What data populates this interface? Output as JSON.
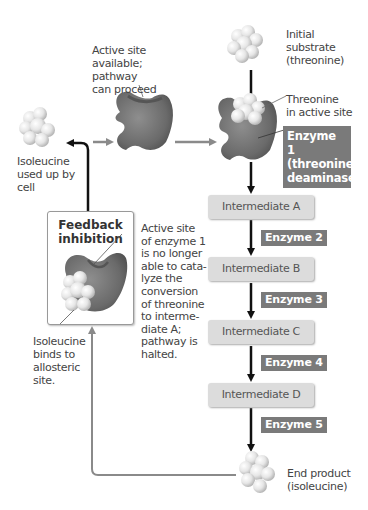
{
  "diagram": {
    "labels": {
      "initial_substrate": "Initial substrate (threonine)",
      "active_site_available": "Active site available; pathway can proceed",
      "threonine_in_active_site": "Threonine in active site",
      "isoleucine_used": "Isoleucine used up by cell",
      "feedback_title": "Feedback inhibition",
      "active_site_blocked": "Active site of enzyme 1 is no longer able to catalyze the conversion of threonine to intermediate A; pathway is halted.",
      "isoleucine_binds": "Isoleucine binds to allosteric site.",
      "end_product": "End product (isoleucine)"
    },
    "label_lines": {
      "initial_substrate": [
        "Initial",
        "substrate",
        "(threonine)"
      ],
      "active_site_available": [
        "Active site",
        "available;",
        "pathway",
        "can proceed"
      ],
      "threonine_in_active_site": [
        "Threonine",
        "in active site"
      ],
      "isoleucine_used": [
        "Isoleucine",
        "used up by",
        "cell"
      ],
      "feedback_title": [
        "Feedback",
        "inhibition"
      ],
      "active_site_blocked": [
        "Active site",
        "of enzyme 1",
        "is no longer",
        "able to cata-",
        "lyze the",
        "conversion",
        "of threonine",
        "to interme-",
        "diate A;",
        "pathway is",
        "halted."
      ],
      "isoleucine_binds": [
        "Isoleucine",
        "binds to",
        "allosteric",
        "site."
      ],
      "end_product": [
        "End product",
        "(isoleucine)"
      ]
    },
    "enzyme1": [
      "Enzyme 1",
      "(threonine",
      "deaminase)"
    ],
    "intermediates": [
      "Intermediate A",
      "Intermediate B",
      "Intermediate C",
      "Intermediate D"
    ],
    "enzymes": [
      "Enzyme 2",
      "Enzyme 3",
      "Enzyme 4",
      "Enzyme 5"
    ],
    "colors": {
      "enzyme_label_bg": "#7a7a7a",
      "intermediate_bg": "#dcdcdc",
      "arrow_main": "#111111",
      "arrow_gray": "#8a8a8a",
      "enzyme_shape": "#6e6e6e"
    }
  }
}
